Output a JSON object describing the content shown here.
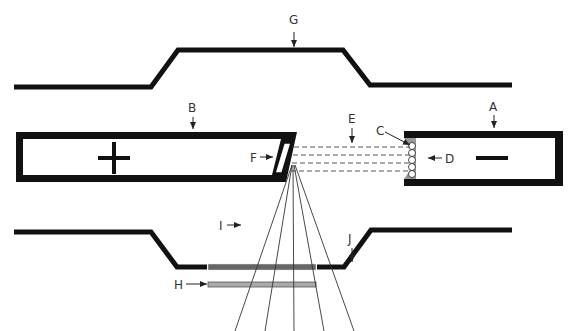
{
  "diagram": {
    "labels": {
      "A": "A",
      "B": "B",
      "C": "C",
      "D": "D",
      "E": "E",
      "F": "F",
      "G": "G",
      "H": "H",
      "I": "I",
      "J": "J"
    },
    "anode_sign": "+",
    "cathode_sign": "−",
    "colors": {
      "outline": "#111111",
      "window": "#666666",
      "filter": "#aaaaaa",
      "focusing_cup": "#999999",
      "rays": "#333333"
    }
  }
}
